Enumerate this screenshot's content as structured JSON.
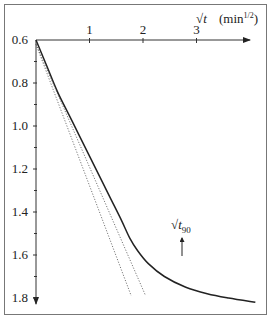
{
  "chart_data": {
    "type": "line",
    "title": "",
    "xlabel": "√t",
    "xunit": "(min^1/2)",
    "ylabel": "",
    "x_ticks": [
      "1",
      "2",
      "3"
    ],
    "y_ticks": [
      "0.6",
      "0.8",
      "1.0",
      "1.2",
      "1.4",
      "1.6",
      "1.8"
    ],
    "xlim": [
      0,
      4.0
    ],
    "ylim": [
      0.6,
      1.82
    ],
    "y_inverted": true,
    "x_axis_position": "top",
    "grid": false,
    "legend": null,
    "series": [
      {
        "name": "settlement curve",
        "style": "solid",
        "x": [
          0,
          0.2,
          0.4,
          0.6,
          0.8,
          1.0,
          1.2,
          1.4,
          1.6,
          1.75,
          1.9,
          2.1,
          2.4,
          2.8,
          3.2,
          3.6,
          4.1
        ],
        "y": [
          0.6,
          0.72,
          0.84,
          0.94,
          1.04,
          1.14,
          1.24,
          1.34,
          1.44,
          1.52,
          1.58,
          1.64,
          1.7,
          1.75,
          1.78,
          1.8,
          1.82
        ]
      },
      {
        "name": "initial tangent",
        "style": "dotted",
        "x": [
          0,
          1.78
        ],
        "y": [
          0.62,
          1.79
        ]
      },
      {
        "name": "1.15× tangent",
        "style": "dotted",
        "x": [
          0,
          2.05
        ],
        "y": [
          0.62,
          1.79
        ]
      }
    ],
    "annotations": [
      {
        "text": "√t",
        "subscript": "90",
        "x": 1.82,
        "y": 1.58,
        "arrow": "up"
      }
    ]
  },
  "labels": {
    "x_axis_symbol": "√t",
    "x_axis_unit_prefix": "(min",
    "x_axis_unit_exp": "1/2",
    "x_axis_unit_suffix": ")",
    "t90_main": "√t",
    "t90_sub": "90"
  }
}
